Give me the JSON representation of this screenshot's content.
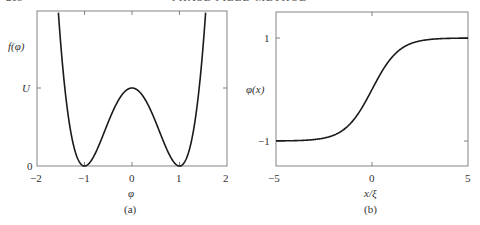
{
  "header": {
    "page_number": "218",
    "running_title": "PHASE FIELD METHOD"
  },
  "chart_data": [
    {
      "type": "line",
      "panel": "(a)",
      "title": "",
      "xlabel": "φ",
      "ylabel": "f(φ)",
      "function": "f(φ) = U(φ² − 1)²",
      "xlim": [
        -2,
        2
      ],
      "ylim": [
        0,
        2.0
      ],
      "xticks": [
        "-2",
        "-1",
        "0",
        "1",
        "2"
      ],
      "xtick_values": [
        -2,
        -1,
        0,
        1,
        2
      ],
      "yticks": [
        "0",
        "U"
      ],
      "ytick_values": [
        0,
        1
      ],
      "grid": false,
      "series": [
        {
          "name": "f(φ)",
          "x": [
            -1.55,
            -1.4,
            -1.25,
            -1.0,
            -0.75,
            -0.5,
            -0.25,
            0,
            0.25,
            0.5,
            0.75,
            1.0,
            1.25,
            1.4,
            1.55
          ],
          "y": [
            1.97,
            0.92,
            0.32,
            0,
            0.19,
            0.56,
            0.88,
            1.0,
            0.88,
            0.56,
            0.19,
            0,
            0.32,
            0.92,
            1.97
          ]
        }
      ]
    },
    {
      "type": "line",
      "panel": "(b)",
      "title": "",
      "xlabel": "x/ξ",
      "ylabel": "φ(x)",
      "function": "φ(x) = tanh(x/(√2 ξ))",
      "xlim": [
        -5,
        5
      ],
      "ylim": [
        -1.5,
        1.5
      ],
      "xticks": [
        "-5",
        "0",
        "5"
      ],
      "xtick_values": [
        -5,
        0,
        5
      ],
      "yticks": [
        "-1",
        "1"
      ],
      "ytick_values": [
        -1,
        1
      ],
      "grid": false,
      "series": [
        {
          "name": "φ(x)",
          "x": [
            -5,
            -4,
            -3,
            -2,
            -1,
            0,
            1,
            2,
            3,
            4,
            5
          ],
          "y": [
            -1.0,
            -0.99,
            -0.97,
            -0.89,
            -0.61,
            0,
            0.61,
            0.89,
            0.97,
            0.99,
            1.0
          ]
        }
      ]
    }
  ],
  "panels": {
    "a": {
      "caption": "(a)",
      "xlabel": "φ",
      "ylabel": "f(φ)",
      "xticks": [
        "−2",
        "−1",
        "0",
        "1",
        "2"
      ],
      "ytick_zero": "0",
      "ytick_u": "U"
    },
    "b": {
      "caption": "(b)",
      "xlabel": "x/ξ",
      "ylabel": "φ(x)",
      "xticks": [
        "−5",
        "0",
        "5"
      ],
      "ytick_pos": "1",
      "ytick_neg": "−1"
    }
  }
}
